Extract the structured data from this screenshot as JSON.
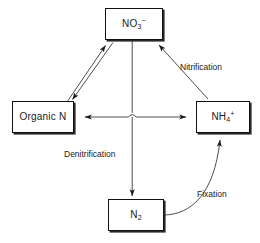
{
  "diagram": {
    "type": "cycle-diagram",
    "background_color": "#ffffff",
    "line_color": "#333333",
    "box_border_color": "#111111",
    "nodes": [
      {
        "id": "nitrate",
        "name": "nitrate-node",
        "formula_base": "NO",
        "subscript": "3",
        "superscript": "−",
        "position": "top"
      },
      {
        "id": "organic-n",
        "name": "organic-nitrogen-node",
        "formula_base": "Organic N",
        "subscript": "",
        "superscript": "",
        "position": "left"
      },
      {
        "id": "ammonium",
        "name": "ammonium-node",
        "formula_base": "NH",
        "subscript": "4",
        "superscript": "+",
        "position": "right"
      },
      {
        "id": "dinitrogen",
        "name": "dinitrogen-node",
        "formula_base": "N",
        "subscript": "2",
        "superscript": "",
        "position": "bottom"
      }
    ],
    "edges": [
      {
        "id": "nitrification",
        "label": "Nitrification",
        "from": "ammonium",
        "to": "nitrate",
        "style": "straight",
        "arrow": "single"
      },
      {
        "id": "denitrification",
        "label": "Denitrification",
        "from": "nitrate",
        "to": "dinitrogen",
        "style": "straight",
        "arrow": "single"
      },
      {
        "id": "fixation",
        "label": "Fixation",
        "from": "dinitrogen",
        "to": "ammonium",
        "style": "curved",
        "arrow": "single"
      },
      {
        "id": "immobilization-mineralization",
        "label": "",
        "from": "organic-n",
        "to": "nitrate",
        "style": "double-parallel",
        "arrow": "bidirectional"
      },
      {
        "id": "organic-ammonium-exchange",
        "label": "",
        "from": "organic-n",
        "to": "ammonium",
        "style": "straight-horizontal",
        "arrow": "bidirectional"
      }
    ]
  }
}
